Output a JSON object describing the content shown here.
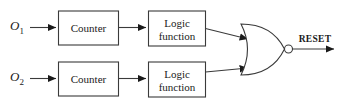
{
  "diagram": {
    "background": "#ffffff",
    "line_color": "#3a3a3a",
    "text_color": "#1a1a1a",
    "inputs": [
      {
        "symbol": "O",
        "subscript": "1"
      },
      {
        "symbol": "O",
        "subscript": "2"
      }
    ],
    "blocks": {
      "counter_label": "Counter",
      "logic_line1": "Logic",
      "logic_line2": "function"
    },
    "gate": {
      "type": "NOR",
      "inputs": 2,
      "inverting_bubble": true
    },
    "output": {
      "label": "RESET"
    },
    "rows": [
      {
        "input_symbol": "O",
        "input_subscript": "1",
        "counter": "Counter",
        "logic_line1": "Logic",
        "logic_line2": "function"
      },
      {
        "input_symbol": "O",
        "input_subscript": "2",
        "counter": "Counter",
        "logic_line1": "Logic",
        "logic_line2": "function"
      }
    ]
  }
}
